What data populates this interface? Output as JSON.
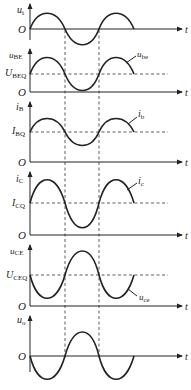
{
  "diagram": {
    "type": "waveform-stack",
    "colors": {
      "line": "#222222",
      "background": "#ffffff"
    },
    "time_label": "t",
    "origin_label": "O",
    "panels": [
      {
        "id": "ui",
        "ylabel": "u",
        "ylabel_sub": "i",
        "q_label": null,
        "q_sub": null,
        "curve_label": null,
        "curve_sub": null
      },
      {
        "id": "ube",
        "ylabel": "u",
        "ylabel_sub": "BE",
        "q_label": "U",
        "q_sub": "BEQ",
        "curve_label": "u",
        "curve_sub": "be"
      },
      {
        "id": "ib",
        "ylabel": "i",
        "ylabel_sub": "B",
        "q_label": "I",
        "q_sub": "BQ",
        "curve_label": "i",
        "curve_sub": "b"
      },
      {
        "id": "ic",
        "ylabel": "i",
        "ylabel_sub": "C",
        "q_label": "I",
        "q_sub": "CQ",
        "curve_label": "i",
        "curve_sub": "c"
      },
      {
        "id": "uce",
        "ylabel": "u",
        "ylabel_sub": "CE",
        "q_label": "U",
        "q_sub": "CEQ",
        "curve_label": "u",
        "curve_sub": "ce"
      },
      {
        "id": "uo",
        "ylabel": "u",
        "ylabel_sub": "o",
        "q_label": null,
        "q_sub": null,
        "curve_label": null,
        "curve_sub": null
      }
    ]
  }
}
